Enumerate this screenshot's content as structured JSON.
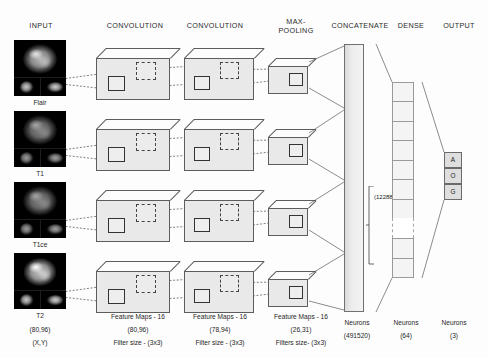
{
  "figure": {
    "type": "cnn-architecture-diagram",
    "title_headers": [
      {
        "label": "INPUT",
        "x": 40,
        "y": 22
      },
      {
        "label": "CONVOLUTION",
        "x": 134,
        "y": 22
      },
      {
        "label": "CONVOLUTION",
        "x": 215,
        "y": 22
      },
      {
        "label": "MAX-\nPOOLING",
        "x": 296,
        "y": 18
      },
      {
        "label": "CONCATENATE",
        "x": 358,
        "y": 22
      },
      {
        "label": "DENSE",
        "x": 410,
        "y": 22
      },
      {
        "label": "OUTPUT",
        "x": 457,
        "y": 22
      }
    ]
  },
  "input": {
    "modalities": [
      "Flair",
      "T1",
      "T1ce",
      "T2"
    ],
    "dimension_label": "(80,96)",
    "axis_label": "(X,Y)"
  },
  "stages": {
    "conv1": {
      "maps_label": "Feature Maps - 16",
      "size_label": "(80,96)",
      "filter_label": "Filter size - (3x3)"
    },
    "conv2": {
      "maps_label": "Feature Maps - 16",
      "size_label": "(78,94)",
      "filter_label": "Filter size - (3x3)"
    },
    "maxpool": {
      "maps_label": "Feature Maps - 16",
      "size_label": "(26,31)",
      "filter_label": "Filters size-  (3x3)"
    },
    "concatenate": {
      "neurons_label": "Neurons",
      "neurons_count": "(491520)",
      "bracket_label": "(122880)"
    },
    "dense": {
      "neurons_label": "Neurons",
      "neurons_count": "(64)"
    },
    "output": {
      "neurons_label": "Neurons",
      "neurons_count": "(3)",
      "classes": [
        "A",
        "O",
        "G"
      ]
    }
  },
  "colors": {
    "box_face": "#e9e9e9",
    "box_edge": "#5d5d5d",
    "wire": "#4a4a4a",
    "background": "#fdfdfd"
  }
}
